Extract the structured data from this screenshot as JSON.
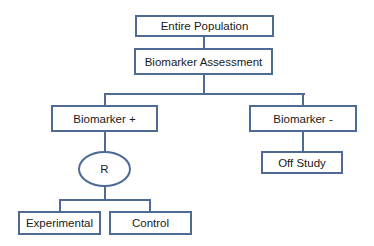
{
  "diagram": {
    "type": "flowchart",
    "nodes": {
      "entire_population": "Entire Population",
      "biomarker_assessment": "Biomarker Assessment",
      "biomarker_positive": "Biomarker +",
      "biomarker_negative": "Biomarker -",
      "randomization": "R",
      "off_study": "Off Study",
      "experimental": "Experimental",
      "control": "Control"
    },
    "edges": [
      [
        "Entire Population",
        "Biomarker Assessment"
      ],
      [
        "Biomarker Assessment",
        "Biomarker +"
      ],
      [
        "Biomarker Assessment",
        "Biomarker -"
      ],
      [
        "Biomarker +",
        "R"
      ],
      [
        "Biomarker -",
        "Off Study"
      ],
      [
        "R",
        "Experimental"
      ],
      [
        "R",
        "Control"
      ]
    ],
    "colors": {
      "line": "#4f6a94",
      "fill": "#ffffff"
    }
  }
}
